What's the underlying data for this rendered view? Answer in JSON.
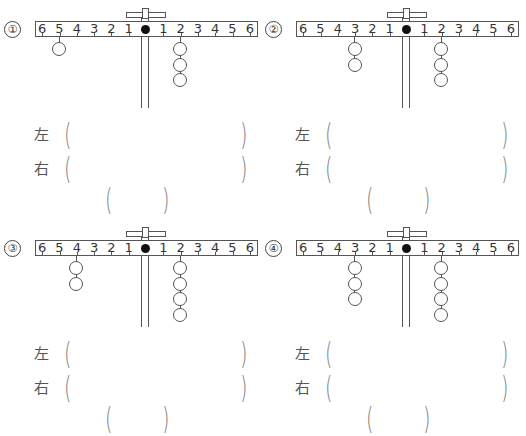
{
  "worksheet": {
    "labels": {
      "left": "左",
      "right": "右",
      "open_paren": "(",
      "close_paren": ")"
    },
    "scale_left": [
      "6",
      "5",
      "4",
      "3",
      "2",
      "1"
    ],
    "scale_right": [
      "1",
      "2",
      "3",
      "4",
      "5",
      "6"
    ],
    "problems": [
      {
        "number": "①",
        "left_weights": {
          "position": 5,
          "count": 1
        },
        "right_weights": {
          "position": 2,
          "count": 3
        }
      },
      {
        "number": "②",
        "left_weights": {
          "position": 3,
          "count": 2
        },
        "right_weights": {
          "position": 2,
          "count": 3
        }
      },
      {
        "number": "③",
        "left_weights": {
          "position": 4,
          "count": 2
        },
        "right_weights": {
          "position": 2,
          "count": 4
        }
      },
      {
        "number": "④",
        "left_weights": {
          "position": 3,
          "count": 3
        },
        "right_weights": {
          "position": 2,
          "count": 4
        }
      }
    ]
  }
}
